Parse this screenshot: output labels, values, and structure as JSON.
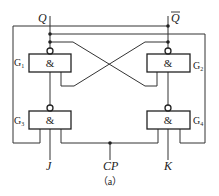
{
  "outputs": {
    "q": "Q",
    "q_bar": "Q"
  },
  "inputs": {
    "j": "J",
    "cp": "CP",
    "k": "K"
  },
  "gates": [
    {
      "id": "G1",
      "name": "G",
      "sub": "1",
      "symbol": "&"
    },
    {
      "id": "G2",
      "name": "G",
      "sub": "2",
      "symbol": "&"
    },
    {
      "id": "G3",
      "name": "G",
      "sub": "3",
      "symbol": "&"
    },
    {
      "id": "G4",
      "name": "G",
      "sub": "4",
      "symbol": "&"
    }
  ],
  "caption": "（a）"
}
